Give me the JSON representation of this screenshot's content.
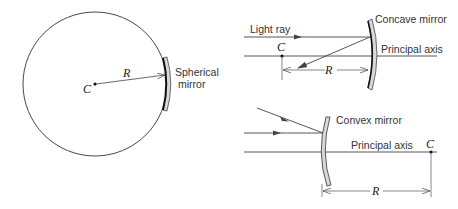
{
  "colors": {
    "line": "#333333",
    "mirror_fill": "#d8d8d8",
    "mirror_edge": "#111111",
    "background": "#ffffff"
  },
  "panel_sphere": {
    "center_label": "C",
    "radius_label": "R",
    "mirror_label_line1": "Spherical",
    "mirror_label_line2": "mirror"
  },
  "panel_concave": {
    "ray_label": "Light ray",
    "center_label": "C",
    "radius_label": "R",
    "mirror_label": "Concave mirror",
    "axis_label": "Principal axis"
  },
  "panel_convex": {
    "mirror_label": "Convex mirror",
    "axis_label": "Principal axis",
    "center_label": "C",
    "radius_label": "R"
  }
}
